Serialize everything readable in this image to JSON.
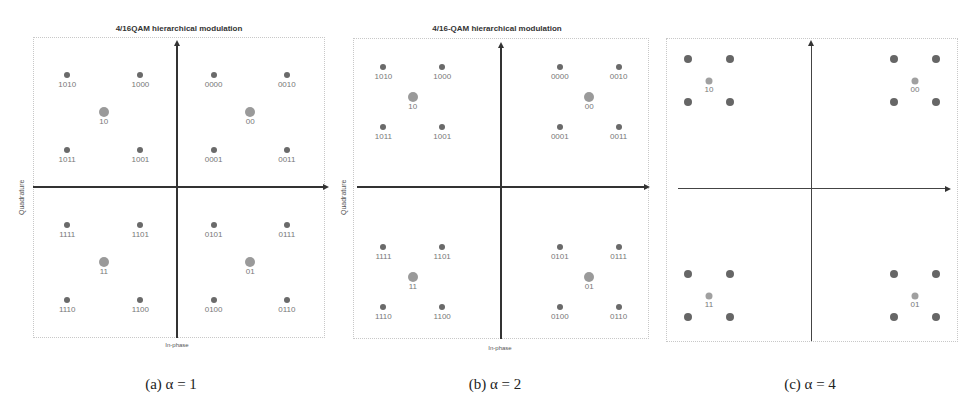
{
  "chart_data": [
    {
      "type": "scatter",
      "title": "4/16QAM hierarchical modulation",
      "xlabel": "In-phase",
      "ylabel": "Quadrature",
      "caption": "(a) α = 1",
      "alpha": 1,
      "grid": false,
      "points": [
        {
          "label": "1010",
          "x": -3,
          "y": 3
        },
        {
          "label": "1000",
          "x": -1,
          "y": 3
        },
        {
          "label": "0000",
          "x": 1,
          "y": 3
        },
        {
          "label": "0010",
          "x": 3,
          "y": 3
        },
        {
          "label": "1011",
          "x": -3,
          "y": 1
        },
        {
          "label": "1001",
          "x": -1,
          "y": 1
        },
        {
          "label": "0001",
          "x": 1,
          "y": 1
        },
        {
          "label": "0011",
          "x": 3,
          "y": 1
        },
        {
          "label": "1111",
          "x": -3,
          "y": -1
        },
        {
          "label": "1101",
          "x": -1,
          "y": -1
        },
        {
          "label": "0101",
          "x": 1,
          "y": -1
        },
        {
          "label": "0111",
          "x": 3,
          "y": -1
        },
        {
          "label": "1110",
          "x": -3,
          "y": -3
        },
        {
          "label": "1100",
          "x": -1,
          "y": -3
        },
        {
          "label": "0100",
          "x": 1,
          "y": -3
        },
        {
          "label": "0110",
          "x": 3,
          "y": -3
        }
      ],
      "centroids": [
        {
          "label": "10",
          "x": -2,
          "y": 2
        },
        {
          "label": "00",
          "x": 2,
          "y": 2
        },
        {
          "label": "11",
          "x": -2,
          "y": -2
        },
        {
          "label": "01",
          "x": 2,
          "y": -2
        }
      ]
    },
    {
      "type": "scatter",
      "title": "4/16-QAM hierarchical modulation",
      "xlabel": "In-phase",
      "ylabel": "Quadrature",
      "caption": "(b) α = 2",
      "alpha": 2,
      "grid": false,
      "points": [
        {
          "label": "1010",
          "x": -4,
          "y": 4
        },
        {
          "label": "1000",
          "x": -2,
          "y": 4
        },
        {
          "label": "0000",
          "x": 2,
          "y": 4
        },
        {
          "label": "0010",
          "x": 4,
          "y": 4
        },
        {
          "label": "1011",
          "x": -4,
          "y": 2
        },
        {
          "label": "1001",
          "x": -2,
          "y": 2
        },
        {
          "label": "0001",
          "x": 2,
          "y": 2
        },
        {
          "label": "0011",
          "x": 4,
          "y": 2
        },
        {
          "label": "1111",
          "x": -4,
          "y": -2
        },
        {
          "label": "1101",
          "x": -2,
          "y": -2
        },
        {
          "label": "0101",
          "x": 2,
          "y": -2
        },
        {
          "label": "0111",
          "x": 4,
          "y": -2
        },
        {
          "label": "1110",
          "x": -4,
          "y": -4
        },
        {
          "label": "1100",
          "x": -2,
          "y": -4
        },
        {
          "label": "0100",
          "x": 2,
          "y": -4
        },
        {
          "label": "0110",
          "x": 4,
          "y": -4
        }
      ],
      "centroids": [
        {
          "label": "10",
          "x": -3,
          "y": 3
        },
        {
          "label": "00",
          "x": 3,
          "y": 3
        },
        {
          "label": "11",
          "x": -3,
          "y": -3
        },
        {
          "label": "01",
          "x": 3,
          "y": -3
        }
      ]
    },
    {
      "type": "scatter",
      "title": "",
      "xlabel": "",
      "ylabel": "",
      "caption": "(c) α = 4",
      "alpha": 4,
      "grid": false,
      "points": [
        {
          "label": "",
          "x": -6,
          "y": 6
        },
        {
          "label": "",
          "x": -4,
          "y": 6
        },
        {
          "label": "",
          "x": 4,
          "y": 6
        },
        {
          "label": "",
          "x": 6,
          "y": 6
        },
        {
          "label": "",
          "x": -6,
          "y": 4
        },
        {
          "label": "",
          "x": -4,
          "y": 4
        },
        {
          "label": "",
          "x": 4,
          "y": 4
        },
        {
          "label": "",
          "x": 6,
          "y": 4
        },
        {
          "label": "",
          "x": -6,
          "y": -4
        },
        {
          "label": "",
          "x": -4,
          "y": -4
        },
        {
          "label": "",
          "x": 4,
          "y": -4
        },
        {
          "label": "",
          "x": 6,
          "y": -4
        },
        {
          "label": "",
          "x": -6,
          "y": -6
        },
        {
          "label": "",
          "x": -4,
          "y": -6
        },
        {
          "label": "",
          "x": 4,
          "y": -6
        },
        {
          "label": "",
          "x": 6,
          "y": -6
        }
      ],
      "centroids": [
        {
          "label": "10",
          "x": -5,
          "y": 5
        },
        {
          "label": "00",
          "x": 5,
          "y": 5
        },
        {
          "label": "11",
          "x": -5,
          "y": -5
        },
        {
          "label": "01",
          "x": 5,
          "y": -5
        }
      ]
    }
  ],
  "panels": [
    {
      "title": "4/16QAM hierarchical modulation",
      "xlabel": "In-phase",
      "ylabel": "Quadrature",
      "caption": "(a) α = 1"
    },
    {
      "title": "4/16-QAM hierarchical modulation",
      "xlabel": "In-phase",
      "ylabel": "Quadrature",
      "caption": "(b) α = 2"
    },
    {
      "title": "",
      "xlabel": "",
      "ylabel": "",
      "caption": "(c) α = 4"
    }
  ],
  "colors": {
    "point": "#6a6a6a",
    "centroid": "#9a9a9a",
    "axis": "#333333",
    "label": "#777777"
  }
}
